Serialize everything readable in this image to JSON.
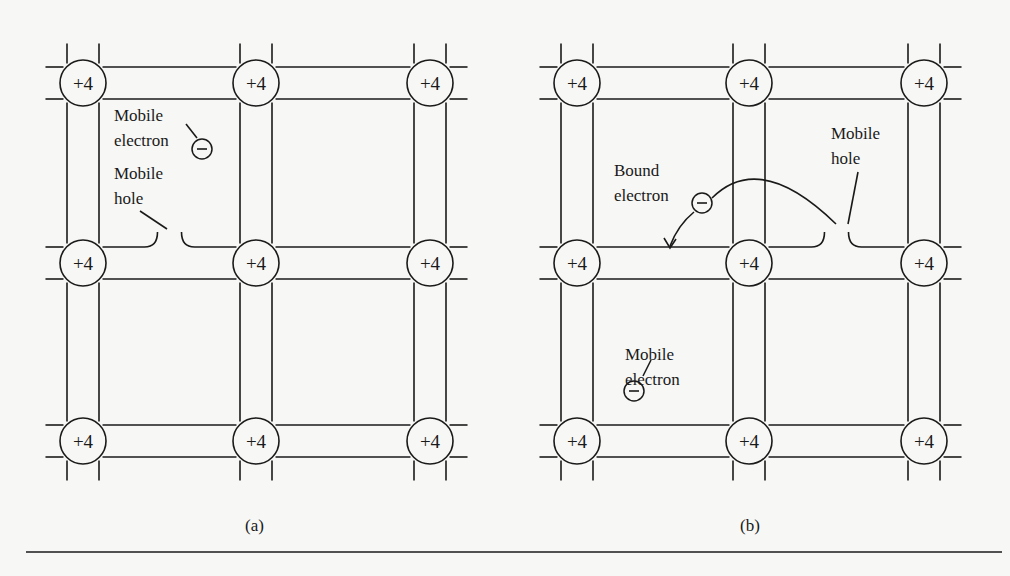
{
  "figure": {
    "type": "semiconductor-crystal-lattice",
    "atom_charge_label": "+4",
    "grid": {
      "rows": 3,
      "cols": 3
    },
    "line_color": "#1a1a1a",
    "background": "#f7f7f5"
  },
  "panel_a": {
    "caption": "(a)",
    "atom_columns_x": [
      83,
      256,
      430
    ],
    "atom_rows_y": [
      83,
      263,
      441
    ],
    "labels": {
      "mobile_electron_line1": "Mobile",
      "mobile_electron_line2": "electron",
      "mobile_hole_line1": "Mobile",
      "mobile_hole_line2": "hole"
    },
    "electron_symbol": "−"
  },
  "panel_b": {
    "caption": "(b)",
    "atom_columns_x": [
      577,
      749,
      924
    ],
    "atom_rows_y": [
      83,
      263,
      441
    ],
    "labels": {
      "bound_electron_line1": "Bound",
      "bound_electron_line2": "electron",
      "mobile_hole_line1": "Mobile",
      "mobile_hole_line2": "hole",
      "mobile_electron_line1": "Mobile",
      "mobile_electron_line2": "electron"
    },
    "electron_symbol": "−"
  }
}
